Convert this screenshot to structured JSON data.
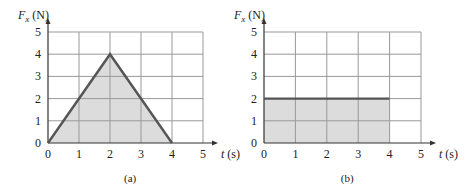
{
  "chart_data": [
    {
      "type": "line",
      "title": "",
      "caption": "(a)",
      "xlabel": "t (s)",
      "ylabel": "F_x (N)",
      "ylabel_main": "F",
      "ylabel_sub": "x",
      "ylabel_unit": " (N)",
      "xlabel_main": "t",
      "xlabel_unit": " (s)",
      "xlim": [
        0,
        5
      ],
      "ylim": [
        0,
        5
      ],
      "xticks": [
        "0",
        "1",
        "2",
        "3",
        "4",
        "5"
      ],
      "yticks": [
        "0",
        "1",
        "2",
        "3",
        "4",
        "5"
      ],
      "grid": true,
      "shaded_area": true,
      "x": [
        0,
        2,
        4
      ],
      "y": [
        0,
        4,
        0
      ]
    },
    {
      "type": "line",
      "title": "",
      "caption": "(b)",
      "xlabel": "t (s)",
      "ylabel": "F_x (N)",
      "ylabel_main": "F",
      "ylabel_sub": "x",
      "ylabel_unit": " (N)",
      "xlabel_main": "t",
      "xlabel_unit": " (s)",
      "xlim": [
        0,
        5
      ],
      "ylim": [
        0,
        5
      ],
      "xticks": [
        "0",
        "1",
        "2",
        "3",
        "4",
        "5"
      ],
      "yticks": [
        "0",
        "1",
        "2",
        "3",
        "4",
        "5"
      ],
      "grid": true,
      "shaded_area": true,
      "x": [
        0,
        4
      ],
      "y": [
        2,
        2
      ]
    }
  ],
  "colors": {
    "line": "#555555",
    "fill": "#dcdcdc",
    "grid": "#999999",
    "axis": "#333333"
  }
}
